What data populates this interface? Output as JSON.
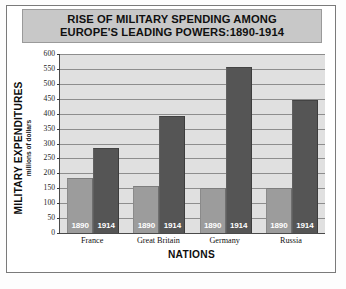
{
  "title": {
    "line1": "RISE OF MILITARY SPENDING AMONG",
    "line2": "EUROPE'S LEADING POWERS:1890-1914"
  },
  "axes": {
    "ylabel_main": "MILITARY EXPENDITURES",
    "ylabel_sub": "millions of dollars",
    "xlabel": "NATIONS"
  },
  "colors": {
    "bar_1890": "#9c9c9c",
    "bar_1914": "#555555",
    "plot_background": "#e0e0e0",
    "gridline": "#8d8d8d",
    "title_banner": "#c8c8c8"
  },
  "chart_data": {
    "type": "bar",
    "title": "RISE OF MILITARY SPENDING AMONG EUROPE'S LEADING POWERS:1890-1914",
    "xlabel": "NATIONS",
    "ylabel": "MILITARY EXPENDITURES (millions of dollars)",
    "categories": [
      "France",
      "Great Britain",
      "Germany",
      "Russia"
    ],
    "series": [
      {
        "name": "1890",
        "values": [
          185,
          157,
          150,
          150
        ]
      },
      {
        "name": "1914",
        "values": [
          285,
          392,
          555,
          446
        ]
      }
    ],
    "ylim": [
      0,
      600
    ],
    "ytick_values": [
      0,
      50,
      100,
      150,
      200,
      250,
      300,
      350,
      400,
      450,
      500,
      550,
      600
    ],
    "ytick_labels": [
      "0",
      "50",
      "100",
      "150",
      "200",
      "250",
      "300",
      "350",
      "400",
      "450",
      "500",
      "550",
      "600"
    ],
    "grid": true,
    "legend": "in-bar year labels",
    "bar_labels": [
      "1890",
      "1914"
    ]
  }
}
